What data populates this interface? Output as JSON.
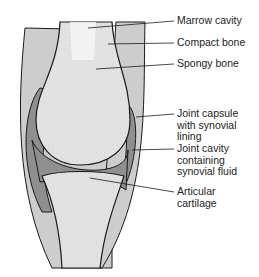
{
  "diagram": {
    "labels": [
      {
        "id": "marrow",
        "text": "Marrow cavity",
        "x": 177,
        "y": 15
      },
      {
        "id": "compact",
        "text": "Compact bone",
        "x": 177,
        "y": 37
      },
      {
        "id": "spongy",
        "text": "Spongy bone",
        "x": 177,
        "y": 58
      },
      {
        "id": "capsule",
        "text": "Joint capsule\nwith synovial\nlining",
        "x": 177,
        "y": 108
      },
      {
        "id": "cavity",
        "text": "Joint cavity\ncontaining\nsynovial fluid",
        "x": 177,
        "y": 143
      },
      {
        "id": "cartilage",
        "text": "Articular\ncartilage",
        "x": 177,
        "y": 186
      }
    ],
    "colors": {
      "outline": "#1a1a1a",
      "soft_tissue": "#c8c8c8",
      "capsule": "#8a8a8a",
      "bone": "#e6e6e6",
      "marrow": "#f6f6f6"
    }
  }
}
